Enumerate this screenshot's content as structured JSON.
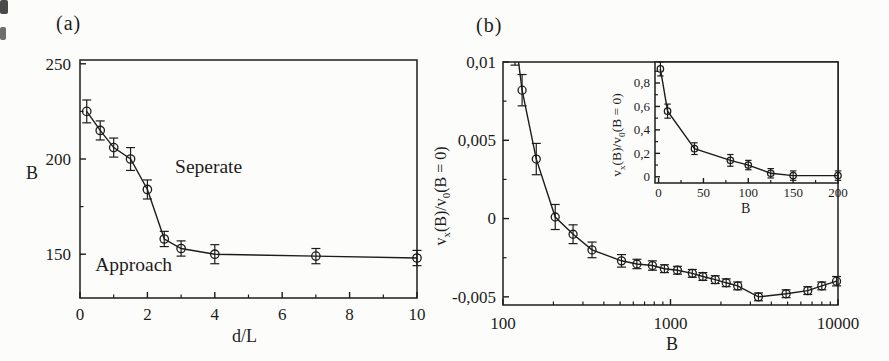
{
  "figure": {
    "bg": "#fcfcfa",
    "ink": "#1c1c1c"
  },
  "chart_data": [
    {
      "id": "panel-a",
      "type": "line",
      "title": "(a)",
      "xlabel": "d/L",
      "ylabel": "B",
      "xscale": "linear",
      "xlim": [
        0,
        10
      ],
      "ylim": [
        127,
        252
      ],
      "xticks": [
        0,
        2,
        4,
        6,
        8,
        10
      ],
      "xtick_labels": [
        "0",
        "2",
        "4",
        "6",
        "8",
        "10"
      ],
      "xminor": [
        1,
        3,
        5,
        7,
        9
      ],
      "yticks": [
        150,
        200,
        250
      ],
      "ytick_labels": [
        "150",
        "200",
        "250"
      ],
      "yminor": [
        175,
        225
      ],
      "grid": false,
      "x": [
        0.2,
        0.6,
        1.0,
        1.5,
        2.0,
        2.5,
        3.0,
        4.0,
        7.0,
        10.0
      ],
      "y": [
        225,
        215,
        206,
        200,
        184,
        158,
        153,
        150,
        149,
        148
      ],
      "yerr": [
        6,
        5,
        5,
        6,
        5,
        4,
        4,
        5,
        4,
        4
      ],
      "annotations": [
        {
          "text": "Seperate",
          "x": 2.82,
          "y": 192.5
        },
        {
          "text": "Approach",
          "x": 0.45,
          "y": 141
        }
      ]
    },
    {
      "id": "panel-b",
      "type": "line",
      "title": "(b)",
      "xlabel": "B",
      "ylabel": "vx(B)/v0(B = 0)",
      "ylabel_parts": [
        "v",
        "x",
        "(B)/v",
        "0",
        "(B = 0)"
      ],
      "xscale": "log",
      "xlim": [
        100,
        10000
      ],
      "ylim": [
        -0.00552,
        0.01
      ],
      "xticks": [
        100,
        1000,
        10000
      ],
      "xtick_labels": [
        "100",
        "1000",
        "10000"
      ],
      "xminor": [
        200,
        300,
        400,
        500,
        600,
        700,
        800,
        900,
        2000,
        3000,
        4000,
        5000,
        6000,
        7000,
        8000,
        9000
      ],
      "yticks": [
        -0.005,
        0,
        0.005,
        0.01
      ],
      "ytick_labels": [
        "-0,005",
        "0",
        "0,005",
        "0,01"
      ],
      "yminor": [
        -0.0025,
        0.0025,
        0.0075
      ],
      "grid": false,
      "x": [
        118,
        130,
        158,
        205,
        262,
        340,
        510,
        630,
        780,
        920,
        1100,
        1350,
        1560,
        1850,
        2150,
        2520,
        3350,
        4900,
        6600,
        8000,
        9800
      ],
      "y": [
        0.0118,
        0.0082,
        0.0038,
        0.0001,
        -0.001,
        -0.002,
        -0.0027,
        -0.0029,
        -0.003,
        -0.0032,
        -0.0033,
        -0.0035,
        -0.0037,
        -0.0039,
        -0.0041,
        -0.0043,
        -0.005,
        -0.0048,
        -0.0046,
        -0.0043,
        -0.004
      ],
      "yerr": [
        0.002,
        0.001,
        0.001,
        0.0008,
        0.0006,
        0.0005,
        0.0004,
        0.0003,
        0.0003,
        0.00025,
        0.00025,
        0.00025,
        0.00025,
        0.00025,
        0.00025,
        0.00025,
        0.00025,
        0.00025,
        0.00025,
        0.00025,
        0.0003
      ],
      "annotations": []
    },
    {
      "id": "panel-b-inset",
      "type": "line",
      "title": "",
      "xlabel": "B",
      "ylabel": "vx(B)/v0(B = 0)",
      "ylabel_parts": [
        "v",
        "x",
        "(B)/v",
        "0",
        "(B = 0)"
      ],
      "xscale": "linear",
      "xlim": [
        -4,
        200
      ],
      "ylim": [
        -0.053,
        0.979
      ],
      "xticks": [
        0,
        50,
        100,
        150,
        200
      ],
      "xtick_labels": [
        "0",
        "50",
        "100",
        "150",
        "200"
      ],
      "xminor": [
        25,
        75,
        125,
        175
      ],
      "yticks": [
        0,
        0.2,
        0.4,
        0.6,
        0.8
      ],
      "ytick_labels": [
        "0",
        "0,2",
        "0,4",
        "0,6",
        "0,8"
      ],
      "yminor": [
        0.1,
        0.3,
        0.5,
        0.7,
        0.9
      ],
      "grid": false,
      "x": [
        2,
        10,
        40,
        80,
        100,
        125,
        150,
        200
      ],
      "y": [
        0.92,
        0.56,
        0.24,
        0.14,
        0.1,
        0.03,
        0.01,
        0.01
      ],
      "yerr": [
        0.06,
        0.06,
        0.05,
        0.05,
        0.04,
        0.04,
        0.04,
        0.04
      ],
      "annotations": []
    }
  ]
}
